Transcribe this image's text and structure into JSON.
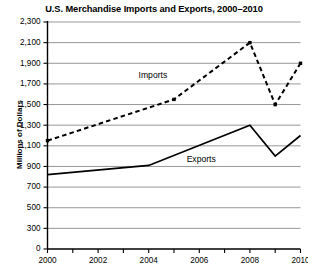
{
  "chart_data": {
    "type": "line",
    "title": "U.S. Merchandise Imports and Exports, 2000–2010",
    "xlabel": "",
    "ylabel": "Millions of Dollars",
    "xlim": [
      2000,
      2010
    ],
    "ylim": [
      0,
      2300
    ],
    "grid": "horizontal",
    "legend": "inline-series-labels",
    "x": [
      2000,
      2005,
      2008,
      2009,
      2010
    ],
    "y_ticks": [
      0,
      300,
      500,
      700,
      900,
      1100,
      1300,
      1500,
      1700,
      1900,
      2100,
      2300
    ],
    "y_tick_labels": [
      "0",
      "300",
      "500",
      "700",
      "900",
      "1,100",
      "1,300",
      "1,500",
      "1,700",
      "1,900",
      "2,100",
      "2,300"
    ],
    "x_ticks": [
      2000,
      2001,
      2002,
      2003,
      2004,
      2005,
      2006,
      2007,
      2008,
      2009,
      2010
    ],
    "x_tick_labels": [
      "2000",
      "",
      "2002",
      "",
      "2004",
      "",
      "2006",
      "",
      "2008",
      "",
      "2010"
    ],
    "x_labeled_ticks": [
      {
        "value": 2000,
        "label": "2000"
      },
      {
        "value": 2002,
        "label": "2002"
      },
      {
        "value": 2004,
        "label": "2004"
      },
      {
        "value": 2006,
        "label": "2006"
      },
      {
        "value": 2008,
        "label": "2008"
      },
      {
        "value": 2010,
        "label": "2010"
      }
    ],
    "series": [
      {
        "name": "Imports",
        "style": "dashed",
        "color": "#000000",
        "markers": true,
        "points": [
          {
            "x": 2000,
            "y": 1150
          },
          {
            "x": 2005,
            "y": 1550
          },
          {
            "x": 2008,
            "y": 2100
          },
          {
            "x": 2009,
            "y": 1500
          },
          {
            "x": 2010,
            "y": 1900
          }
        ],
        "values": [
          1150,
          1550,
          2100,
          1500,
          1900
        ],
        "label_text": "Imports"
      },
      {
        "name": "Exports",
        "style": "solid",
        "color": "#000000",
        "markers": false,
        "points": [
          {
            "x": 2000,
            "y": 820
          },
          {
            "x": 2004,
            "y": 910
          },
          {
            "x": 2008,
            "y": 1300
          },
          {
            "x": 2009,
            "y": 1000
          },
          {
            "x": 2010,
            "y": 1200
          }
        ],
        "values": [
          820,
          910,
          1300,
          1000,
          1200
        ],
        "label_text": "Exports"
      }
    ],
    "annotations": [
      {
        "text": "Imports",
        "x": 2003.6,
        "y": 1790
      },
      {
        "text": "Exports",
        "x": 2005.5,
        "y": 975
      }
    ]
  },
  "colors": {
    "background": "#ffffff",
    "axis": "#000000",
    "gridline": "#8c8c8c",
    "series": "#000000"
  }
}
